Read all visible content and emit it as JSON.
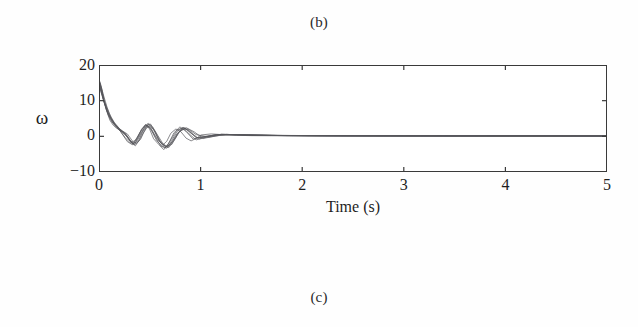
{
  "figure": {
    "caption_above": "(b)",
    "caption_below": "(c)"
  },
  "chart_data": {
    "type": "line",
    "title": "",
    "subtitle": "",
    "xlabel": "Time (s)",
    "ylabel": "ω",
    "xlim": [
      0,
      5
    ],
    "ylim": [
      -10,
      20
    ],
    "xticks": [
      0,
      1,
      2,
      3,
      4,
      5
    ],
    "xtick_labels": [
      "0",
      "1",
      "2",
      "3",
      "4",
      "5"
    ],
    "yticks": [
      20,
      10,
      0,
      -10
    ],
    "ytick_labels": [
      "20",
      "10",
      "0",
      "−10"
    ],
    "grid": false,
    "legend": null,
    "legend_position": "none",
    "line_color": "#55565a",
    "frame_color": "#3a3a3a",
    "background": "#ffffff",
    "annotations": [],
    "series": [
      {
        "name": "trace-1",
        "x": [
          0,
          0.02,
          0.04,
          0.06,
          0.08,
          0.1,
          0.13,
          0.16,
          0.2,
          0.24,
          0.27,
          0.3,
          0.33,
          0.36,
          0.4,
          0.43,
          0.46,
          0.5,
          0.54,
          0.58,
          0.62,
          0.66,
          0.7,
          0.75,
          0.8,
          0.85,
          0.9,
          0.95,
          1.0,
          1.1,
          1.2,
          1.35,
          1.5,
          1.8,
          2.2,
          2.8,
          3.5,
          4.2,
          5.0
        ],
        "y": [
          15.0,
          13.2,
          10.4,
          7.8,
          5.9,
          4.4,
          3.1,
          2.3,
          1.6,
          1.1,
          0.6,
          -0.6,
          -1.8,
          -2.1,
          -1.0,
          0.9,
          2.3,
          3.0,
          1.4,
          -1.2,
          -2.6,
          -1.5,
          0.8,
          2.0,
          1.2,
          -0.6,
          -1.4,
          -0.7,
          0.3,
          0.6,
          0.4,
          0.2,
          0.1,
          0.05,
          0.03,
          0.02,
          0.01,
          0.01,
          0.0
        ]
      },
      {
        "name": "trace-2",
        "x": [
          0,
          0.03,
          0.06,
          0.1,
          0.14,
          0.18,
          0.22,
          0.26,
          0.3,
          0.34,
          0.38,
          0.42,
          0.46,
          0.5,
          0.55,
          0.6,
          0.65,
          0.7,
          0.76,
          0.82,
          0.88,
          0.95,
          1.05,
          1.2,
          1.4,
          1.7,
          2.1,
          2.6,
          3.2,
          4.0,
          5.0
        ],
        "y": [
          14.2,
          11.0,
          7.6,
          4.8,
          3.2,
          2.0,
          1.1,
          0.2,
          -1.3,
          -2.6,
          -1.4,
          1.1,
          2.8,
          2.2,
          -0.4,
          -2.9,
          -3.4,
          -1.1,
          1.7,
          2.4,
          0.6,
          -1.1,
          -0.4,
          0.5,
          0.3,
          0.15,
          0.08,
          0.04,
          0.02,
          0.01,
          0.0
        ]
      },
      {
        "name": "trace-3",
        "x": [
          0,
          0.03,
          0.07,
          0.11,
          0.15,
          0.2,
          0.25,
          0.29,
          0.33,
          0.37,
          0.41,
          0.45,
          0.49,
          0.53,
          0.58,
          0.63,
          0.68,
          0.73,
          0.79,
          0.85,
          0.92,
          1.0,
          1.15,
          1.3,
          1.55,
          1.9,
          2.4,
          3.0,
          3.8,
          4.5,
          5.0
        ],
        "y": [
          15.5,
          12.1,
          8.2,
          5.1,
          3.4,
          1.9,
          0.8,
          -0.9,
          -2.2,
          -0.6,
          1.9,
          3.3,
          2.0,
          -0.8,
          -2.4,
          -3.9,
          -2.0,
          0.9,
          2.6,
          1.3,
          -0.9,
          -0.3,
          0.4,
          0.35,
          0.2,
          0.1,
          0.05,
          0.03,
          0.01,
          0.01,
          0.0
        ]
      },
      {
        "name": "trace-4",
        "x": [
          0,
          0.04,
          0.08,
          0.12,
          0.17,
          0.22,
          0.27,
          0.31,
          0.35,
          0.39,
          0.44,
          0.48,
          0.52,
          0.57,
          0.62,
          0.67,
          0.72,
          0.78,
          0.84,
          0.9,
          0.98,
          1.1,
          1.25,
          1.45,
          1.75,
          2.2,
          2.9,
          3.6,
          4.4,
          5.0
        ],
        "y": [
          13.8,
          9.6,
          6.2,
          4.0,
          2.4,
          1.2,
          -0.4,
          -1.9,
          -2.8,
          -1.1,
          1.5,
          3.6,
          2.6,
          0.2,
          -2.1,
          -3.2,
          -1.4,
          1.2,
          2.2,
          0.9,
          -0.8,
          0.1,
          0.45,
          0.3,
          0.15,
          0.07,
          0.03,
          0.02,
          0.01,
          0.0
        ]
      },
      {
        "name": "trace-5",
        "x": [
          0,
          0.03,
          0.07,
          0.12,
          0.16,
          0.21,
          0.26,
          0.3,
          0.34,
          0.38,
          0.43,
          0.47,
          0.51,
          0.56,
          0.61,
          0.66,
          0.71,
          0.77,
          0.83,
          0.89,
          0.96,
          1.05,
          1.2,
          1.4,
          1.65,
          2.0,
          2.5,
          3.1,
          3.9,
          4.6,
          5.0
        ],
        "y": [
          14.6,
          10.8,
          7.1,
          4.4,
          2.8,
          1.5,
          0.3,
          -1.5,
          -2.4,
          -0.3,
          2.1,
          3.1,
          1.5,
          -1.3,
          -2.8,
          -3.5,
          -1.2,
          1.6,
          2.5,
          1.0,
          -0.6,
          -0.1,
          0.5,
          0.33,
          0.18,
          0.09,
          0.04,
          0.02,
          0.01,
          0.01,
          0.0
        ]
      },
      {
        "name": "trace-6",
        "x": [
          0,
          0.04,
          0.09,
          0.14,
          0.19,
          0.24,
          0.28,
          0.32,
          0.36,
          0.41,
          0.45,
          0.5,
          0.55,
          0.6,
          0.65,
          0.7,
          0.76,
          0.82,
          0.88,
          0.95,
          1.05,
          1.15,
          1.3,
          1.5,
          1.85,
          2.3,
          2.9,
          3.7,
          4.5,
          5.0
        ],
        "y": [
          14.9,
          10.2,
          6.5,
          3.9,
          2.2,
          0.9,
          -0.8,
          -2.3,
          -1.7,
          0.8,
          2.9,
          3.4,
          1.0,
          -1.8,
          -3.1,
          -2.2,
          0.6,
          2.3,
          1.6,
          -0.5,
          -0.2,
          0.4,
          0.38,
          0.22,
          0.11,
          0.06,
          0.03,
          0.01,
          0.01,
          0.0
        ]
      },
      {
        "name": "trace-7",
        "x": [
          0,
          0.05,
          0.1,
          0.15,
          0.2,
          0.25,
          0.3,
          0.35,
          0.4,
          0.45,
          0.5,
          0.56,
          0.62,
          0.68,
          0.74,
          0.8,
          0.87,
          0.95,
          1.08,
          1.25,
          1.5,
          1.9,
          2.4,
          3.1,
          4.0,
          5.0
        ],
        "y": [
          13.4,
          8.9,
          5.4,
          3.1,
          1.4,
          -0.5,
          -2.0,
          -1.2,
          1.3,
          3.2,
          2.4,
          -0.6,
          -2.6,
          -3.3,
          -0.9,
          1.9,
          2.0,
          0.4,
          -0.3,
          0.45,
          0.26,
          0.13,
          0.06,
          0.03,
          0.01,
          0.0
        ]
      },
      {
        "name": "trace-8",
        "x": [
          0,
          0.04,
          0.09,
          0.15,
          0.21,
          0.27,
          0.32,
          0.37,
          0.42,
          0.47,
          0.53,
          0.59,
          0.65,
          0.71,
          0.78,
          0.85,
          0.93,
          1.02,
          1.18,
          1.4,
          1.7,
          2.15,
          2.7,
          3.4,
          4.3,
          5.0
        ],
        "y": [
          15.2,
          9.9,
          5.8,
          3.3,
          1.0,
          -1.6,
          -2.5,
          -0.4,
          2.2,
          3.5,
          1.8,
          -1.5,
          -3.0,
          -2.4,
          1.1,
          2.4,
          1.2,
          -0.7,
          0.2,
          0.4,
          0.2,
          0.1,
          0.05,
          0.02,
          0.01,
          0.0
        ]
      }
    ]
  }
}
